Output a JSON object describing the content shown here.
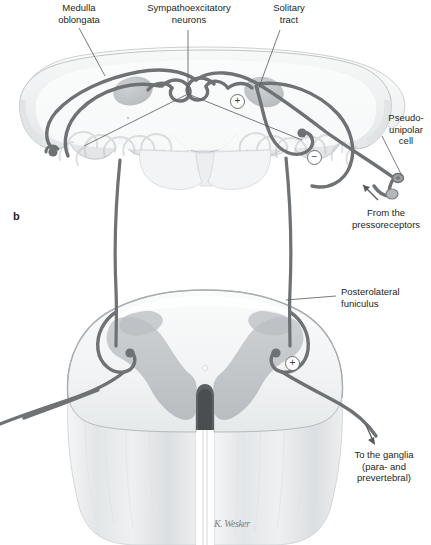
{
  "figure": {
    "panel_letter": "b",
    "signature": "K. Wesker",
    "width": 431,
    "height": 545,
    "background_color": "#ffffff"
  },
  "colors": {
    "pathway": "#6e7275",
    "pathway_dark": "#55585b",
    "leader_line": "#58595b",
    "text": "#231f20",
    "tissue_light": "#f2f3f4",
    "tissue_mid": "#dcdfe1",
    "tissue_dark": "#c3c7ca",
    "nucleus_gray": "#b9bdc0",
    "outline": "#9fa3a6"
  },
  "labels": {
    "medulla_oblongata": "Medulla\noblongata",
    "sympathoexcitatory_neurons": "Sympathoexcitatory\nneurons",
    "solitary_tract": "Solitary\ntract",
    "pseudounipolar_cell": "Pseudo-\nunipolar\ncell",
    "from_the_pressoreceptors": "From the\npressoreceptors",
    "posterolateral_funiculus": "Posterolateral\nfuniculus",
    "to_the_ganglia": "To the ganglia\n(para- and\nprevertebral)"
  },
  "sign_markers": [
    {
      "id": "medulla-excitatory",
      "symbol": "+",
      "x": 230,
      "y": 94
    },
    {
      "id": "medulla-inhibitory",
      "symbol": "−",
      "x": 307,
      "y": 150
    },
    {
      "id": "cord-excitatory",
      "symbol": "+",
      "x": 285,
      "y": 356
    }
  ],
  "diagram": {
    "upper_section_name": "medulla-oblongata-cross-section",
    "lower_section_name": "spinal-cord-cross-section",
    "pathways": [
      "baroreceptor-afferent",
      "solitary-tract-relay",
      "descending-sympathetic-tract",
      "preganglionic-efferent"
    ]
  }
}
